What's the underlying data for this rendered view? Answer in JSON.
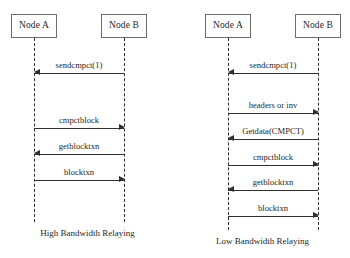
{
  "figure": {
    "background_color": "#ffffff",
    "line_color": "#2f2f2f",
    "box_border_color": "#6b6b6b",
    "text_color": "#1f1f1f"
  },
  "diagrams": [
    {
      "id": "high-bandwidth",
      "caption": "High Bandwidth Relaying",
      "participants": [
        {
          "id": "node-a",
          "label": "Node A"
        },
        {
          "id": "node-b",
          "label": "Node B"
        }
      ],
      "messages": [
        {
          "label": "sendcmpct(1)",
          "from": "node-b",
          "to": "node-a",
          "direction": "left"
        },
        {
          "label": "cmpctblock",
          "from": "node-a",
          "to": "node-b",
          "direction": "right"
        },
        {
          "label": "getblocktxn",
          "from": "node-b",
          "to": "node-a",
          "direction": "left"
        },
        {
          "label": "blocktxn",
          "from": "node-a",
          "to": "node-b",
          "direction": "right"
        }
      ]
    },
    {
      "id": "low-bandwidth",
      "caption": "Low Bandwidth Relaying",
      "participants": [
        {
          "id": "node-a",
          "label": "Node A"
        },
        {
          "id": "node-b",
          "label": "Node B"
        }
      ],
      "messages": [
        {
          "label": "sendcmpct(1)",
          "from": "node-b",
          "to": "node-a",
          "direction": "left"
        },
        {
          "label": "headers or inv",
          "from": "node-a",
          "to": "node-b",
          "direction": "right"
        },
        {
          "label": "Getdata(CMPCT)",
          "from": "node-b",
          "to": "node-a",
          "direction": "left"
        },
        {
          "label": "cmpctblock",
          "from": "node-a",
          "to": "node-b",
          "direction": "right"
        },
        {
          "label": "getblocktxn",
          "from": "node-b",
          "to": "node-a",
          "direction": "left"
        },
        {
          "label": "blocktxn",
          "from": "node-a",
          "to": "node-b",
          "direction": "right"
        }
      ]
    }
  ]
}
